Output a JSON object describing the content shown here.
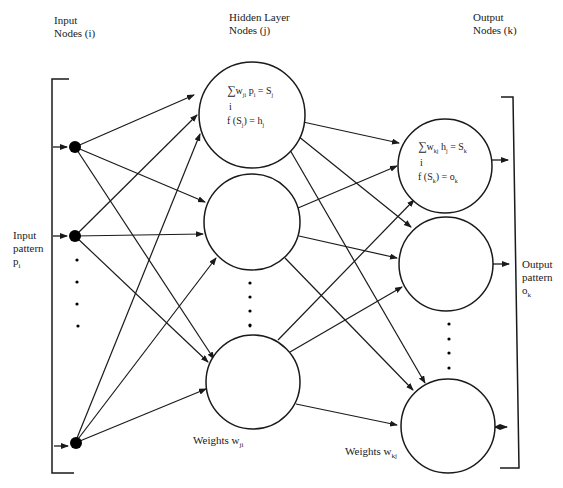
{
  "diagram": {
    "type": "feedforward-neural-network",
    "layers": {
      "input": {
        "title_line1": "Input",
        "title_line2": "Nodes (i)"
      },
      "hidden": {
        "title_line1": "Hidden Layer",
        "title_line2": "Nodes (j)"
      },
      "output": {
        "title_line1": "Output",
        "title_line2": "Nodes (k)"
      }
    },
    "input_pattern": {
      "line1": "Input",
      "line2": "pattern",
      "line3": "p",
      "line3_sub": "i"
    },
    "output_pattern": {
      "line1": "Output",
      "line2": "pattern",
      "line3": "o",
      "line3_sub": "k"
    },
    "hidden_formula": {
      "sum_symbol": "∑",
      "sum_term": "w",
      "sum_term_sub": "ji",
      "sum_var": " p",
      "sum_var_sub": "i",
      "sum_result": " = S",
      "sum_result_sub": "j",
      "sum_index": "i",
      "activation": "f (S",
      "activation_sub": "j",
      "activation_result": ") = h",
      "activation_result_sub": "j"
    },
    "output_formula": {
      "sum_symbol": "∑",
      "sum_term": "w",
      "sum_term_sub": "kj",
      "sum_var": " h",
      "sum_var_sub": "j",
      "sum_result": " = S",
      "sum_result_sub": "k",
      "sum_index": "i",
      "activation": "f (S",
      "activation_sub": "k",
      "activation_result": ") = o",
      "activation_result_sub": "k"
    },
    "weights_hidden": {
      "label": "Weights w",
      "sub": "ji"
    },
    "weights_output": {
      "label": "Weights w",
      "sub": "kj"
    },
    "colors": {
      "stroke": "#1a1a1a",
      "node_fill": "#ffffff",
      "input_node_fill": "#000000",
      "background": "#ffffff"
    }
  }
}
